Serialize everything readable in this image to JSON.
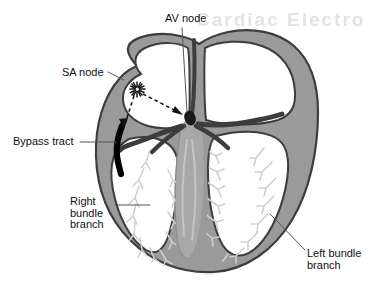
{
  "figure": {
    "background_color": "#ffffff",
    "watermark_text": "Cardiac Electro",
    "colors": {
      "myocardium_fill": "#9a9a9a",
      "myocardium_outline": "#3d3d3d",
      "septum_fill": "#a8a8a8",
      "purkinje_fiber": "#cfcfcf",
      "node_dark": "#1a1a1a",
      "bypass_tract": "#000000",
      "leader_line": "#555555",
      "label_text": "#111111",
      "chamber_fill": "#ffffff",
      "watermark": "#e3e3e3"
    }
  },
  "labels": [
    {
      "id": "av-node",
      "text": "AV node",
      "x": 165,
      "y": 13,
      "leader": "vertical line from label down to the AV node"
    },
    {
      "id": "sa-node",
      "text": "SA node",
      "x": 62,
      "y": 68,
      "leader": "short dash to upper right wall of right atrium"
    },
    {
      "id": "bypass-tract",
      "text": "Bypass tract",
      "x": 13,
      "y": 136,
      "leader": "horizontal line to the black accessory pathway"
    },
    {
      "id": "right-bundle-branch",
      "text": "Right\nbundle\nbranch",
      "x": 70,
      "y": 196,
      "leader": "horizontal line to the right ventricular wall"
    },
    {
      "id": "left-bundle-branch",
      "text": "Left bundle\nbranch",
      "x": 307,
      "y": 248,
      "leader": "diagonal line up-left to the left ventricular wall"
    }
  ],
  "anatomy": {
    "structures": [
      {
        "name": "right-atrium",
        "description": "upper left chamber of drawing"
      },
      {
        "name": "left-atrium",
        "description": "upper right chamber of drawing"
      },
      {
        "name": "right-ventricle",
        "description": "lower left chamber of drawing"
      },
      {
        "name": "left-ventricle",
        "description": "lower right chamber of drawing"
      },
      {
        "name": "interventricular-septum",
        "description": "central gray wall carrying the bundle of His"
      },
      {
        "name": "sa-node",
        "description": "starburst pacemaker in right atrial wall"
      },
      {
        "name": "av-node",
        "description": "dark oval at the base of the atrial septum"
      },
      {
        "name": "bundle-of-his",
        "description": "gray trunk descending in the septum"
      },
      {
        "name": "bypass-tract",
        "description": "black accessory conduction pathway across the right AV groove"
      },
      {
        "name": "purkinje-fibers",
        "description": "fine branching twigs on the ventricular endocardium"
      },
      {
        "name": "conduction-arrows",
        "description": "dashed arrows radiating from the SA node"
      }
    ]
  }
}
